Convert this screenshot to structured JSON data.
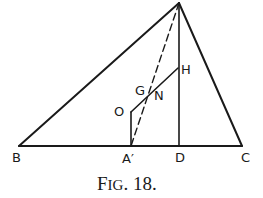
{
  "figure": {
    "caption_first": "F",
    "caption_small": "IG",
    "caption_rest": ". 18."
  },
  "points": {
    "B": {
      "label": "B"
    },
    "C": {
      "label": "C"
    },
    "D": {
      "label": "D"
    },
    "A_prime": {
      "label": "A′"
    },
    "O": {
      "label": "O"
    },
    "G": {
      "label": "G"
    },
    "N": {
      "label": "N"
    },
    "H": {
      "label": "H"
    }
  },
  "colors": {
    "ink": "#1a1a1a",
    "background": "#ffffff"
  }
}
